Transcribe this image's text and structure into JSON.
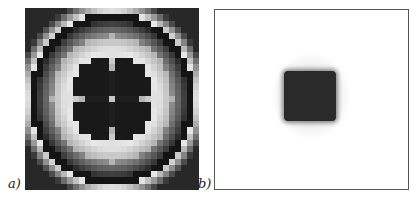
{
  "figure": {
    "panels": [
      {
        "label": "a)",
        "description": "Radial gray-level map with four-lobed dark clover center and dark circular ring",
        "grid_size": 29
      },
      {
        "label": "b)",
        "description": "White field with a single dark square blob at center surrounded by faint gray halo"
      }
    ]
  }
}
